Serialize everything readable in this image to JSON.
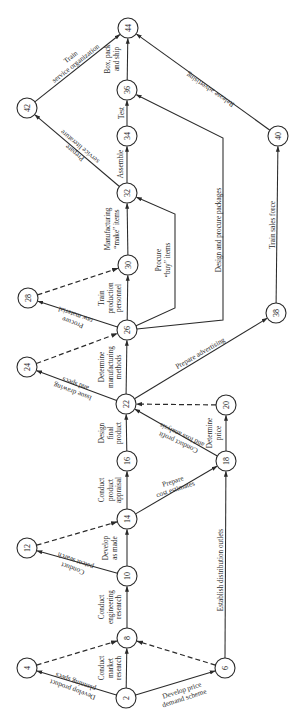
{
  "diagram": {
    "type": "PERT network (activity-on-arrow), product development project",
    "nodes": [
      "2",
      "4",
      "6",
      "8",
      "10",
      "12",
      "14",
      "16",
      "18",
      "20",
      "22",
      "24",
      "26",
      "28",
      "30",
      "32",
      "34",
      "36",
      "38",
      "40",
      "42",
      "44"
    ],
    "edges": [
      {
        "from": "2",
        "to": "4",
        "label": [
          "Develop product",
          "planning specs"
        ],
        "dashed": false
      },
      {
        "from": "2",
        "to": "8",
        "label": [
          "Conduct",
          "market",
          "research"
        ],
        "dashed": false
      },
      {
        "from": "2",
        "to": "6",
        "label": [
          "Develop price",
          "demand scheme"
        ],
        "dashed": false
      },
      {
        "from": "4",
        "to": "8",
        "label": [],
        "dashed": true
      },
      {
        "from": "6",
        "to": "8",
        "label": [],
        "dashed": true
      },
      {
        "from": "6",
        "to": "18",
        "label": [
          "Establish distribution outlets"
        ],
        "dashed": false
      },
      {
        "from": "8",
        "to": "10",
        "label": [
          "Conduct",
          "engineering",
          "research"
        ],
        "dashed": false
      },
      {
        "from": "10",
        "to": "12",
        "label": [
          "Conduct",
          "patent search"
        ],
        "dashed": false
      },
      {
        "from": "10",
        "to": "14",
        "label": [
          "Develop",
          "as made"
        ],
        "dashed": false
      },
      {
        "from": "12",
        "to": "14",
        "label": [],
        "dashed": true
      },
      {
        "from": "14",
        "to": "16",
        "label": [
          "Conduct",
          "product",
          "appraisal"
        ],
        "dashed": false
      },
      {
        "from": "14",
        "to": "18",
        "label": [
          "Prepare",
          "cost estimates"
        ],
        "dashed": false
      },
      {
        "from": "16",
        "to": "22",
        "label": [
          "Design",
          "final",
          "product"
        ],
        "dashed": false
      },
      {
        "from": "18",
        "to": "22",
        "label": [
          "Conduct profit",
          "and loss analysis"
        ],
        "dashed": false
      },
      {
        "from": "18",
        "to": "20",
        "label": [
          "Determine",
          "price"
        ],
        "dashed": false
      },
      {
        "from": "20",
        "to": "22",
        "label": [],
        "dashed": true
      },
      {
        "from": "22",
        "to": "24",
        "label": [
          "Issue drawing",
          "and specs"
        ],
        "dashed": false
      },
      {
        "from": "22",
        "to": "26",
        "label": [
          "Determine",
          "manufacturing",
          "methods"
        ],
        "dashed": false
      },
      {
        "from": "22",
        "to": "38",
        "label": [
          "Prepare advertising"
        ],
        "dashed": false
      },
      {
        "from": "24",
        "to": "26",
        "label": [],
        "dashed": true
      },
      {
        "from": "26",
        "to": "28",
        "label": [
          "Procure",
          "raw material"
        ],
        "dashed": false
      },
      {
        "from": "26",
        "to": "30",
        "label": [
          "Train",
          "production",
          "personnel"
        ],
        "dashed": false
      },
      {
        "from": "26",
        "to": "32",
        "label": [
          "Procure",
          "“buy” items"
        ],
        "dashed": false
      },
      {
        "from": "26",
        "to": "36",
        "label": [
          "Design and procure packages"
        ],
        "dashed": false
      },
      {
        "from": "28",
        "to": "30",
        "label": [],
        "dashed": true
      },
      {
        "from": "30",
        "to": "32",
        "label": [
          "Manufacturing",
          "“make” items"
        ],
        "dashed": false
      },
      {
        "from": "32",
        "to": "34",
        "label": [
          "Assemble"
        ],
        "dashed": false
      },
      {
        "from": "32",
        "to": "42",
        "label": [
          "Prepare",
          "service literature"
        ],
        "dashed": false
      },
      {
        "from": "34",
        "to": "36",
        "label": [
          "Test"
        ],
        "dashed": false
      },
      {
        "from": "36",
        "to": "44",
        "label": [
          "Box, pack",
          "and ship"
        ],
        "dashed": false
      },
      {
        "from": "38",
        "to": "40",
        "label": [
          "Train sales force"
        ],
        "dashed": false
      },
      {
        "from": "40",
        "to": "44",
        "label": [
          "Release advertising"
        ],
        "dashed": false
      },
      {
        "from": "42",
        "to": "44",
        "label": [
          "Train",
          "service organization"
        ],
        "dashed": false
      }
    ]
  }
}
